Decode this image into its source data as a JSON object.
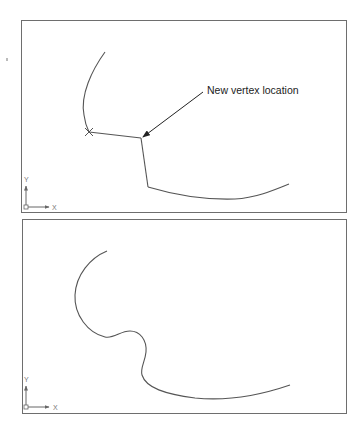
{
  "figure": {
    "panels": [
      {
        "id": "top",
        "description": "Polyline with moved vertex (before spline fit)",
        "callout": {
          "label": "New vertex location",
          "arrow_from": [
            203,
            92
          ],
          "arrow_to": [
            143,
            137
          ]
        },
        "marker": {
          "type": "x",
          "position": [
            89,
            132
          ]
        },
        "vertices": [
          [
            89,
            132
          ],
          [
            141,
            138
          ],
          [
            148,
            187
          ]
        ],
        "ucs_icon": {
          "x_label": "X",
          "y_label": "Y"
        }
      },
      {
        "id": "bottom",
        "description": "Resulting smoothed curve after spline fit",
        "ucs_icon": {
          "x_label": "X",
          "y_label": "Y"
        }
      }
    ],
    "colors": {
      "line": "#555555",
      "frame": "#6e6e6e",
      "text": "#222222"
    }
  }
}
